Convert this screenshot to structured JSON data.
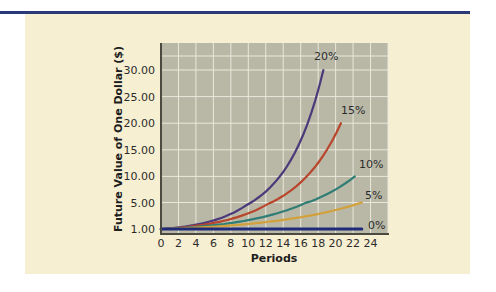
{
  "chart_data": {
    "type": "line",
    "title": "",
    "xlabel": "Periods",
    "ylabel": "Future Value of One Dollar ($)",
    "x_ticks": [
      "0",
      "2",
      "4",
      "6",
      "8",
      "10",
      "12",
      "14",
      "16",
      "18",
      "20",
      "22",
      "24"
    ],
    "y_ticks": [
      "1.00",
      "5.00",
      "10.00",
      "15.00",
      "20.00",
      "25.00",
      "30.00"
    ],
    "xlim": [
      0,
      24
    ],
    "ylim": [
      1,
      30
    ],
    "grid": true,
    "legend": "inline labels at line ends",
    "series": [
      {
        "name": "20%",
        "rate": 0.2,
        "color": "#4b3a7a",
        "x_end": 18.6,
        "y_end": 30.0
      },
      {
        "name": "15%",
        "rate": 0.15,
        "color": "#b8452c",
        "x_end": 20.6,
        "y_end": 20.0
      },
      {
        "name": "10%",
        "rate": 0.1,
        "color": "#2f7d75",
        "x_end": 22.2,
        "y_end": 10.0
      },
      {
        "name": "5%",
        "rate": 0.05,
        "color": "#d3a13c",
        "x_end": 23.0,
        "y_end": 5.0
      },
      {
        "name": "0%",
        "rate": 0.0,
        "color": "#1f2a78",
        "x_end": 23.0,
        "y_end": 1.0
      }
    ]
  },
  "labels": {
    "xlabel": "Periods",
    "ylabel": "Future Value of One Dollar ($)",
    "series": [
      "20%",
      "15%",
      "10%",
      "5%",
      "0%"
    ]
  },
  "colors": {
    "rule": "#2a3a78",
    "panel": "#f7efd2",
    "plot_bg": "#b9b8a6",
    "grid": "#e9e8dc"
  }
}
